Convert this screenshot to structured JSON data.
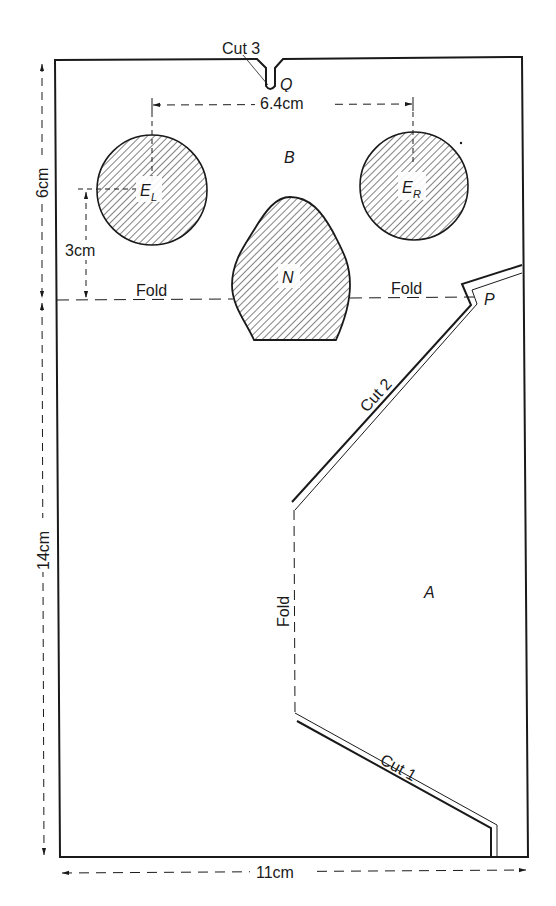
{
  "diagram": {
    "regions": {
      "upper": "B",
      "lower": "A"
    },
    "features": {
      "left_eye": {
        "label": "E",
        "subscript": "L"
      },
      "right_eye": {
        "label": "E",
        "subscript": "R"
      },
      "nose": {
        "label": "N"
      }
    },
    "points": {
      "q": "Q",
      "p": "P"
    },
    "cuts": {
      "cut1": "Cut 1",
      "cut2": "Cut 2",
      "cut3": "Cut 3"
    },
    "folds": {
      "horizontal_left": "Fold",
      "horizontal_right": "Fold",
      "vertical": "Fold"
    },
    "dimensions": {
      "eye_spacing": "6.4cm",
      "top_height": "6cm",
      "eye_height": "3cm",
      "bottom_height": "14cm",
      "width": "11cm"
    },
    "colors": {
      "ink": "#1a1a1a",
      "background": "#ffffff"
    }
  }
}
